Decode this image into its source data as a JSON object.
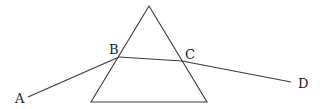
{
  "diagram": {
    "labels": {
      "A": "A",
      "B": "B",
      "C": "C",
      "D": "D"
    },
    "colors": {
      "line": "#3a3a3a",
      "text": "#1a1a1a",
      "background": "#ffffff"
    }
  }
}
